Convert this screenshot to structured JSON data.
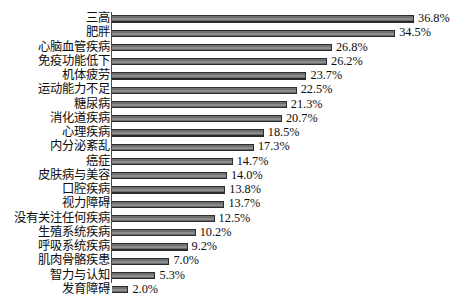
{
  "chart_data": {
    "type": "bar",
    "orientation": "horizontal",
    "title": "",
    "xlabel": "",
    "ylabel": "",
    "xlim": [
      0,
      38
    ],
    "grid": false,
    "legend": null,
    "value_suffix": "%",
    "categories": [
      "三高",
      "肥胖",
      "心脑血管疾病",
      "免疫功能低下",
      "机体疲劳",
      "运动能力不足",
      "糖尿病",
      "消化道疾病",
      "心理疾病",
      "内分泌紊乱",
      "癌症",
      "皮肤病与美容",
      "口腔疾病",
      "视力障碍",
      "没有关注任何疾病",
      "生殖系统疾病",
      "呼吸系统疾病",
      "肌肉骨骼疾患",
      "智力与认知",
      "发育障碍"
    ],
    "values": [
      36.8,
      34.5,
      26.8,
      26.2,
      23.7,
      22.5,
      21.3,
      20.7,
      18.5,
      17.3,
      14.7,
      14.0,
      13.8,
      13.7,
      12.5,
      10.2,
      9.2,
      7.0,
      5.3,
      2.0
    ],
    "data_labels": [
      "36.8%",
      "34.5%",
      "26.8%",
      "26.2%",
      "23.7%",
      "22.5%",
      "21.3%",
      "20.7%",
      "18.5%",
      "17.3%",
      "14.7%",
      "14.0%",
      "13.8%",
      "13.7%",
      "12.5%",
      "10.2%",
      "9.2%",
      "7.0%",
      "5.3%",
      "2.0%"
    ],
    "bar_color": "#7a7a7a",
    "bar_edge_color": "#2b2b2b",
    "axis_color": "#4a4a4a",
    "background_color": "#ffffff"
  },
  "title_remnant": " "
}
